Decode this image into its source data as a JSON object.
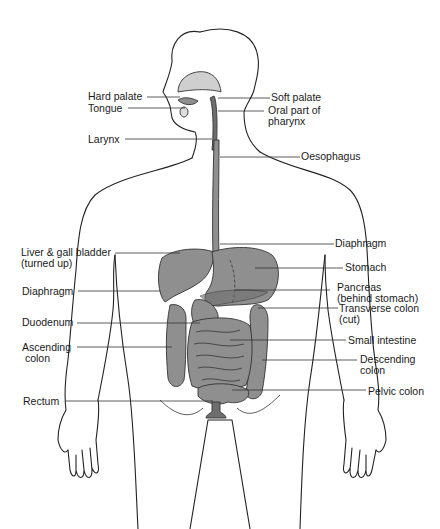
{
  "diagram": {
    "fill_color": "#8f8f8f",
    "line_color": "#222222",
    "labels_left": [
      {
        "id": "hard-palate",
        "text": "Hard palate",
        "x": 88,
        "y": 90
      },
      {
        "id": "tongue",
        "text": "Tongue",
        "x": 88,
        "y": 104
      },
      {
        "id": "larynx",
        "text": "Larynx",
        "x": 88,
        "y": 134
      },
      {
        "id": "liver-gall-bladder",
        "text": "Liver & gall bladder\n(turned up)",
        "x": 21,
        "y": 247
      },
      {
        "id": "diaphragm-left",
        "text": "Diaphragm",
        "x": 22,
        "y": 287
      },
      {
        "id": "duodenum",
        "text": "Duodenum",
        "x": 22,
        "y": 318
      },
      {
        "id": "ascending-colon",
        "text": "Ascending\n colon",
        "x": 22,
        "y": 341
      },
      {
        "id": "rectum",
        "text": "Rectum",
        "x": 23,
        "y": 397
      }
    ],
    "labels_right": [
      {
        "id": "soft-palate",
        "text": "Soft palate",
        "x": 271,
        "y": 92
      },
      {
        "id": "oral-pharynx",
        "text": "Oral part of\npharynx",
        "x": 268,
        "y": 105
      },
      {
        "id": "oesophagus",
        "text": "Oesophagus",
        "x": 300,
        "y": 150
      },
      {
        "id": "diaphragm-right",
        "text": "Diaphragm",
        "x": 335,
        "y": 237
      },
      {
        "id": "stomach",
        "text": "Stomach",
        "x": 345,
        "y": 261
      },
      {
        "id": "pancreas",
        "text": "Pancreas\n(behind stomach)",
        "x": 337,
        "y": 280
      },
      {
        "id": "transverse-colon",
        "text": "Transverse colon\n(cut)",
        "x": 339,
        "y": 306
      },
      {
        "id": "small-intestine",
        "text": "Small intestine",
        "x": 348,
        "y": 335
      },
      {
        "id": "descending-colon",
        "text": "Descending\ncolon",
        "x": 359,
        "y": 354
      },
      {
        "id": "pelvic-colon",
        "text": "Pelvic colon",
        "x": 368,
        "y": 385
      }
    ]
  }
}
